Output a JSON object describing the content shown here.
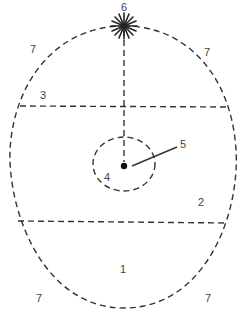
{
  "diagram": {
    "colors": {
      "line": "#333333",
      "label": "#444444",
      "background": "#ffffff"
    },
    "labels": [
      {
        "id": "label-6",
        "text": "6",
        "x": 124,
        "y": 7
      },
      {
        "id": "label-7-top-left",
        "text": "7",
        "x": 33,
        "y": 49
      },
      {
        "id": "label-7-top-right",
        "text": "7",
        "x": 207,
        "y": 52
      },
      {
        "id": "label-3",
        "text": "3",
        "x": 43,
        "y": 95
      },
      {
        "id": "label-5",
        "text": "5",
        "x": 183,
        "y": 144
      },
      {
        "id": "label-4",
        "text": "4",
        "x": 107,
        "y": 177
      },
      {
        "id": "label-2",
        "text": "2",
        "x": 201,
        "y": 202
      },
      {
        "id": "label-1",
        "text": "1",
        "x": 123,
        "y": 269
      },
      {
        "id": "label-7-bottom-left",
        "text": "7",
        "x": 39,
        "y": 298
      },
      {
        "id": "label-7-bottom-right",
        "text": "7",
        "x": 208,
        "y": 298
      }
    ],
    "shapes": {
      "outer_egg": {
        "cx": 124,
        "top": 26,
        "bottom": 308,
        "left": 8,
        "right": 238,
        "widest_y": 160
      },
      "upper_chord": {
        "y1": 106,
        "y2": 107,
        "x1": 20,
        "x2": 228
      },
      "lower_chord": {
        "y1": 221,
        "y2": 223,
        "x1": 18,
        "x2": 228
      },
      "vertical_axis": {
        "x": 124,
        "y1": 26,
        "y2": 166
      },
      "inner_ellipse": {
        "cx": 124,
        "cy": 164,
        "rx": 31,
        "ry": 27
      },
      "center_dot": {
        "cx": 124,
        "cy": 166,
        "r": 3
      },
      "pointer_line": {
        "x1": 132,
        "y1": 166,
        "x2": 177,
        "y2": 147
      },
      "star": {
        "cx": 124,
        "cy": 26,
        "r": 13,
        "rays": 8
      }
    }
  }
}
